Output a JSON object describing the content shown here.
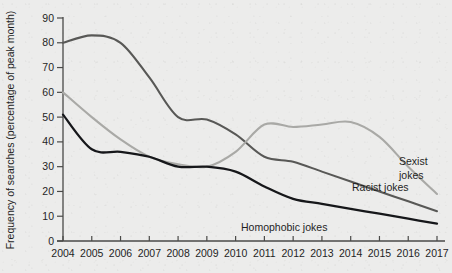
{
  "chart_data": {
    "type": "line",
    "title": "",
    "xlabel": "",
    "ylabel": "Frequency of searches (percentage of peak month)",
    "x": [
      2004,
      2005,
      2006,
      2007,
      2008,
      2009,
      2010,
      2011,
      2012,
      2013,
      2014,
      2015,
      2016,
      2017
    ],
    "xtick_labels": [
      "2004",
      "2005",
      "2006",
      "2007",
      "2008",
      "2009",
      "2010",
      "2011",
      "2012",
      "2013",
      "2014",
      "2015",
      "2016",
      "2017"
    ],
    "ytick_labels": [
      "0",
      "10",
      "20",
      "30",
      "40",
      "50",
      "60",
      "70",
      "80",
      "90"
    ],
    "yticks": [
      0,
      10,
      20,
      30,
      40,
      50,
      60,
      70,
      80,
      90
    ],
    "ylim": [
      0,
      90
    ],
    "xlim": [
      2004,
      2017
    ],
    "grid": false,
    "legend_position": "inline-right",
    "series": [
      {
        "name": "Racist jokes",
        "label": "Racist jokes",
        "color": "#585856",
        "width": 2.1,
        "label_x": 352,
        "label_y": 191,
        "values": [
          80,
          83,
          80,
          66,
          50,
          49,
          43,
          34,
          32,
          28,
          24,
          20,
          16,
          12
        ]
      },
      {
        "name": "Sexist jokes",
        "label": "Sexist jokes",
        "color": "#a9a9a6",
        "width": 2.1,
        "label_x": 399,
        "label_y": 165,
        "label_line2": "jokes",
        "values": [
          60,
          50,
          41,
          34,
          31,
          30,
          36,
          47,
          46,
          47,
          48,
          42,
          30,
          19
        ]
      },
      {
        "name": "Homophobic jokes",
        "label": "Homophobic jokes",
        "color": "#16171a",
        "width": 2.3,
        "label_x": 241,
        "label_y": 231,
        "values": [
          51,
          37,
          36,
          34,
          30,
          30,
          28,
          22,
          17,
          15,
          13,
          11,
          9,
          7
        ]
      }
    ]
  },
  "labels": {
    "sexist_line1": "Sexist",
    "sexist_line2": "jokes",
    "racist": "Racist jokes",
    "homophobic": "Homophobic jokes"
  },
  "colors": {
    "background": "#ececeb",
    "axis": "#4a4a48",
    "text": "#1f1f1f",
    "racist": "#585856",
    "sexist": "#a9a9a6",
    "homophobic": "#16171a"
  }
}
